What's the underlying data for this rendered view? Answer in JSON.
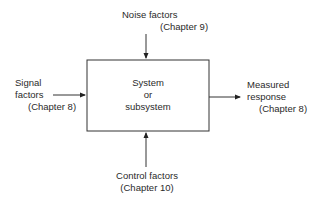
{
  "system": {
    "line1": "System",
    "line2": "or",
    "line3": "subsystem"
  },
  "noise": {
    "line1": "Noise factors",
    "line2": "(Chapter 9)"
  },
  "signal": {
    "line1": "Signal",
    "line2": "factors",
    "line3": "(Chapter 8)"
  },
  "response": {
    "line1": "Measured",
    "line2": "response",
    "line3": "(Chapter 8)"
  },
  "control": {
    "line1": "Control factors",
    "line2": "(Chapter 10)"
  }
}
